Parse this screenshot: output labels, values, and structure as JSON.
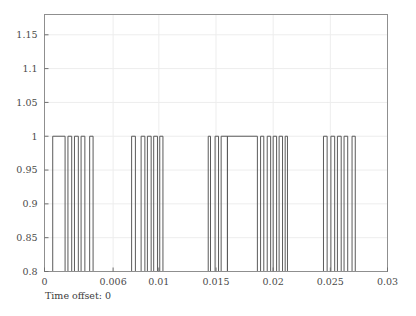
{
  "figure": {
    "caption": "Time offset: 0",
    "background_color": "#ffffff",
    "frame_color": "#8f8f8f",
    "grid_color": "#ededed",
    "trace_color": "#5a5a5a"
  },
  "chart_data": {
    "type": "line",
    "title": "",
    "xlabel": "",
    "ylabel": "",
    "annotations": [
      "Time offset: 0"
    ],
    "grid": true,
    "legend": "none",
    "xlim": [
      0,
      0.03
    ],
    "ylim": [
      0.8,
      1.18
    ],
    "xticks": [
      0,
      0.006,
      0.01,
      0.015,
      0.02,
      0.025,
      0.03
    ],
    "xtick_labels": [
      "0",
      "0.006",
      "0.01",
      "0.015",
      "0.02",
      "0.025",
      "0.03"
    ],
    "yticks": [
      0.8,
      0.85,
      0.9,
      0.95,
      1,
      1.05,
      1.1,
      1.15
    ],
    "ytick_labels": [
      "0.8",
      "0.85",
      "0.9",
      "0.95",
      "1",
      "1.05",
      "1.1",
      "1.15"
    ],
    "baseline": 0.8,
    "pulse_level": 1,
    "series": [
      {
        "name": "signal",
        "color": "#5a5a5a",
        "pulses": [
          [
            0.00072,
            0.0018
          ],
          [
            0.00205,
            0.00238
          ],
          [
            0.00262,
            0.00296
          ],
          [
            0.0032,
            0.00353
          ],
          [
            0.00395,
            0.00425
          ],
          [
            0.00762,
            0.00795
          ],
          [
            0.00845,
            0.00878
          ],
          [
            0.009,
            0.00933
          ],
          [
            0.00955,
            0.00988
          ],
          [
            0.01008,
            0.01036
          ],
          [
            0.01432,
            0.01452
          ],
          [
            0.01492,
            0.01522
          ],
          [
            0.01545,
            0.016
          ],
          [
            0.016,
            0.01862
          ],
          [
            0.0189,
            0.01918
          ],
          [
            0.01948,
            0.01978
          ],
          [
            0.02,
            0.0203
          ],
          [
            0.02052,
            0.02082
          ],
          [
            0.02105,
            0.02125
          ],
          [
            0.0244,
            0.02472
          ],
          [
            0.02505,
            0.02538
          ],
          [
            0.02562,
            0.02595
          ],
          [
            0.0262,
            0.02652
          ],
          [
            0.0269,
            0.02718
          ]
        ]
      }
    ]
  }
}
